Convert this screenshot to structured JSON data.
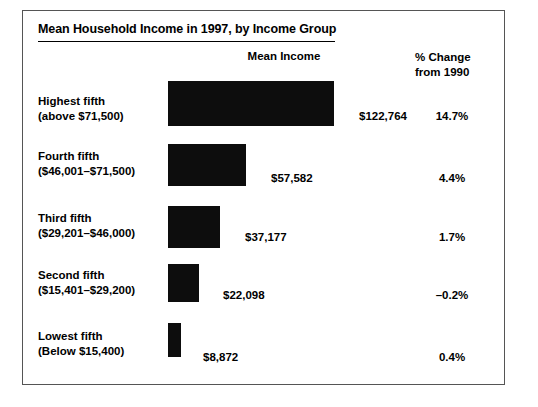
{
  "chart_data": {
    "type": "bar",
    "title": "Mean Household Income in 1997, by Income Group",
    "orientation": "horizontal",
    "xlabel": "",
    "ylabel": "",
    "grid": false,
    "legend": "none",
    "column_headers": {
      "bars": "Mean Income",
      "secondary_line1": "% Change",
      "secondary_line2": "from 1990"
    },
    "categories": [
      "Highest fifth (above $71,500)",
      "Fourth fifth ($46,001–$71,500)",
      "Third fifth ($29,201–$46,000)",
      "Second fifth ($15,401–$29,200)",
      "Lowest fifth (Below $15,400)"
    ],
    "values": [
      122764,
      57582,
      37177,
      22098,
      8872
    ],
    "value_labels": [
      "$122,764",
      "$57,582",
      "$37,177",
      "$22,098",
      "$8,872"
    ],
    "secondary_values": [
      14.7,
      4.4,
      1.7,
      -0.2,
      0.4
    ],
    "secondary_labels": [
      "14.7%",
      "4.4%",
      "1.7%",
      "–0.2%",
      "0.4%"
    ],
    "xlim": [
      0,
      122764
    ],
    "bar_color": "#0d0d0d",
    "background_color": "#ffffff",
    "border_color": "#555555"
  },
  "rows": [
    {
      "label_line1": "Highest fifth",
      "label_line2": "(above $71,500)",
      "value_label": "$122,764",
      "pct_label": "14.7%",
      "bar_width": 166,
      "bar_height": 45,
      "bar_top": 70,
      "label_top": 83,
      "value_left": 336,
      "value_top": 99,
      "pct_top": 99
    },
    {
      "label_line1": "Fourth fifth",
      "label_line2": "($46,001–$71,500)",
      "value_label": "$57,582",
      "pct_label": "4.4%",
      "bar_width": 78,
      "bar_height": 42,
      "bar_top": 133,
      "label_top": 138,
      "value_left": 248,
      "value_top": 161,
      "pct_top": 161
    },
    {
      "label_line1": "Third fifth",
      "label_line2": "($29,201–$46,000)",
      "value_label": "$37,177",
      "pct_label": "1.7%",
      "bar_width": 52,
      "bar_height": 42,
      "bar_top": 195,
      "label_top": 200,
      "value_left": 222,
      "value_top": 220,
      "pct_top": 220
    },
    {
      "label_line1": "Second fifth",
      "label_line2": "($15,401–$29,200)",
      "value_label": "$22,098",
      "pct_label": "–0.2%",
      "bar_width": 31,
      "bar_height": 38,
      "bar_top": 253,
      "label_top": 257,
      "value_left": 200,
      "value_top": 278,
      "pct_top": 278
    },
    {
      "label_line1": "Lowest fifth",
      "label_line2": "(Below $15,400)",
      "value_label": "$8,872",
      "pct_label": "0.4%",
      "bar_width": 13,
      "bar_height": 34,
      "bar_top": 312,
      "label_top": 318,
      "value_left": 180,
      "value_top": 340,
      "pct_top": 340
    }
  ]
}
